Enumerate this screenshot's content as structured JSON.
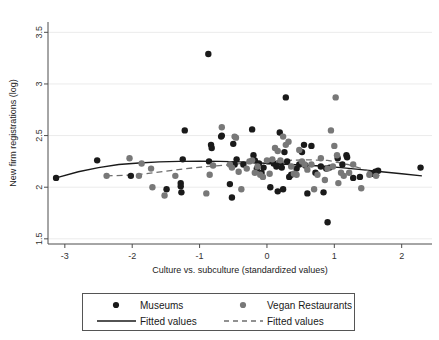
{
  "chart_data": {
    "type": "scatter",
    "title": "",
    "xlabel": "Culture vs. subculture (standardized values)",
    "ylabel": "New firm registrations (log)",
    "xlim": [
      -3.25,
      2.45
    ],
    "ylim": [
      1.45,
      3.6
    ],
    "xticks": [
      -3,
      -2,
      -1,
      0,
      1,
      2
    ],
    "xticklabels": [
      "-3",
      "-2",
      "-1",
      "0",
      "1",
      "2"
    ],
    "yticks": [
      1.5,
      2,
      2.5,
      3,
      3.5
    ],
    "yticklabels": [
      "1.5",
      "2",
      "2.5",
      "3",
      "3.5"
    ],
    "grid": "horizontal",
    "legend_position": "below",
    "colors": {
      "museums": "#1a1a1a",
      "vegan": "#787878",
      "fit_museums": "#1a1a1a",
      "fit_vegan": "#6e6e6e",
      "grid": "#ebebeb",
      "axis": "#4d4d4d",
      "background": "#ffffff"
    },
    "legend": [
      {
        "label": "Museums",
        "marker": "dot",
        "color": "#1a1a1a"
      },
      {
        "label": "Vegan Restaurants",
        "marker": "dot",
        "color": "#787878"
      },
      {
        "label": "Fitted values",
        "marker": "solid-line",
        "color": "#1a1a1a"
      },
      {
        "label": "Fitted values",
        "marker": "dashed-line",
        "color": "#6e6e6e"
      }
    ],
    "series": [
      {
        "name": "Museums",
        "marker": "dot",
        "color": "#1a1a1a",
        "points": [
          [
            -3.13,
            2.09
          ],
          [
            -2.52,
            2.26
          ],
          [
            -2.02,
            2.11
          ],
          [
            -1.49,
            1.98
          ],
          [
            -1.28,
            2.04
          ],
          [
            -1.28,
            2.01
          ],
          [
            -1.27,
            1.95
          ],
          [
            -1.25,
            2.27
          ],
          [
            -1.22,
            2.55
          ],
          [
            -0.87,
            3.29
          ],
          [
            -0.86,
            2.25
          ],
          [
            -0.83,
            2.41
          ],
          [
            -0.82,
            2.38
          ],
          [
            -0.68,
            2.49
          ],
          [
            -0.67,
            2.5
          ],
          [
            -0.55,
            2.03
          ],
          [
            -0.52,
            1.9
          ],
          [
            -0.5,
            2.42
          ],
          [
            -0.48,
            2.22
          ],
          [
            -0.45,
            2.27
          ],
          [
            -0.35,
            2.22
          ],
          [
            -0.22,
            2.56
          ],
          [
            -0.2,
            2.31
          ],
          [
            -0.18,
            2.26
          ],
          [
            -0.15,
            2.18
          ],
          [
            -0.12,
            2.23
          ],
          [
            -0.08,
            2.14
          ],
          [
            -0.05,
            2.19
          ],
          [
            0.02,
            2.25
          ],
          [
            0.05,
            2.0
          ],
          [
            0.1,
            2.23
          ],
          [
            0.14,
            2.2
          ],
          [
            0.16,
            1.96
          ],
          [
            0.19,
            2.53
          ],
          [
            0.2,
            2.24
          ],
          [
            0.22,
            2.19
          ],
          [
            0.24,
            1.98
          ],
          [
            0.26,
            2.34
          ],
          [
            0.28,
            2.87
          ],
          [
            0.3,
            2.25
          ],
          [
            0.33,
            2.1
          ],
          [
            0.36,
            2.12
          ],
          [
            0.44,
            2.18
          ],
          [
            0.48,
            2.22
          ],
          [
            0.52,
            2.34
          ],
          [
            0.55,
            2.41
          ],
          [
            0.57,
            2.21
          ],
          [
            0.6,
            1.94
          ],
          [
            0.66,
            2.4
          ],
          [
            0.72,
            2.14
          ],
          [
            0.8,
            2.2
          ],
          [
            0.84,
            1.95
          ],
          [
            0.88,
            2.18
          ],
          [
            0.9,
            1.66
          ],
          [
            0.93,
            2.19
          ],
          [
            1.05,
            2.28
          ],
          [
            1.12,
            2.22
          ],
          [
            1.18,
            2.31
          ],
          [
            1.19,
            2.29
          ],
          [
            1.28,
            2.09
          ],
          [
            1.38,
            2.1
          ],
          [
            1.57,
            2.13
          ],
          [
            1.61,
            2.15
          ],
          [
            1.65,
            2.16
          ],
          [
            2.28,
            2.19
          ]
        ]
      },
      {
        "name": "Vegan Restaurants",
        "marker": "dot",
        "color": "#787878",
        "points": [
          [
            -2.38,
            2.11
          ],
          [
            -2.04,
            2.28
          ],
          [
            -1.9,
            2.11
          ],
          [
            -1.86,
            2.23
          ],
          [
            -1.72,
            2.18
          ],
          [
            -1.7,
            2.0
          ],
          [
            -1.52,
            1.92
          ],
          [
            -1.36,
            2.11
          ],
          [
            -0.9,
            1.94
          ],
          [
            -0.85,
            2.12
          ],
          [
            -0.8,
            2.21
          ],
          [
            -0.67,
            2.58
          ],
          [
            -0.55,
            2.22
          ],
          [
            -0.52,
            2.19
          ],
          [
            -0.48,
            2.49
          ],
          [
            -0.46,
            2.48
          ],
          [
            -0.42,
            2.15
          ],
          [
            -0.38,
            1.98
          ],
          [
            -0.3,
            2.18
          ],
          [
            -0.26,
            2.25
          ],
          [
            -0.22,
            2.26
          ],
          [
            -0.18,
            2.14
          ],
          [
            -0.14,
            2.2
          ],
          [
            -0.1,
            2.12
          ],
          [
            -0.06,
            2.1
          ],
          [
            0.0,
            2.26
          ],
          [
            0.04,
            2.13
          ],
          [
            0.08,
            2.27
          ],
          [
            0.12,
            2.38
          ],
          [
            0.16,
            2.35
          ],
          [
            0.2,
            2.26
          ],
          [
            0.24,
            2.49
          ],
          [
            0.28,
            2.41
          ],
          [
            0.32,
            2.44
          ],
          [
            0.36,
            2.2
          ],
          [
            0.4,
            2.13
          ],
          [
            0.44,
            2.12
          ],
          [
            0.48,
            2.36
          ],
          [
            0.52,
            2.25
          ],
          [
            0.56,
            2.22
          ],
          [
            0.6,
            2.17
          ],
          [
            0.66,
            2.22
          ],
          [
            0.7,
            1.98
          ],
          [
            0.75,
            2.12
          ],
          [
            0.8,
            2.28
          ],
          [
            0.86,
            2.07
          ],
          [
            0.9,
            2.18
          ],
          [
            0.95,
            2.55
          ],
          [
            0.98,
            2.2
          ],
          [
            1.0,
            2.4
          ],
          [
            1.02,
            2.87
          ],
          [
            1.04,
            2.31
          ],
          [
            1.06,
            2.04
          ],
          [
            1.1,
            2.14
          ],
          [
            1.14,
            2.11
          ],
          [
            1.22,
            2.14
          ],
          [
            1.28,
            2.22
          ],
          [
            1.4,
            1.99
          ],
          [
            1.52,
            2.12
          ],
          [
            1.62,
            2.11
          ]
        ]
      }
    ],
    "fits": [
      {
        "name": "Fitted values (Museums)",
        "style": "solid",
        "color": "#1a1a1a",
        "points": [
          [
            -3.13,
            2.09
          ],
          [
            -2.8,
            2.15
          ],
          [
            -2.5,
            2.19
          ],
          [
            -2.2,
            2.22
          ],
          [
            -1.9,
            2.235
          ],
          [
            -1.6,
            2.245
          ],
          [
            -1.3,
            2.25
          ],
          [
            -1.0,
            2.252
          ],
          [
            -0.7,
            2.25
          ],
          [
            -0.4,
            2.245
          ],
          [
            -0.1,
            2.235
          ],
          [
            0.2,
            2.225
          ],
          [
            0.5,
            2.215
          ],
          [
            0.8,
            2.205
          ],
          [
            1.1,
            2.19
          ],
          [
            1.4,
            2.17
          ],
          [
            1.7,
            2.15
          ],
          [
            2.0,
            2.13
          ],
          [
            2.3,
            2.11
          ]
        ]
      },
      {
        "name": "Fitted values (Vegan Restaurants)",
        "style": "dashed",
        "color": "#6e6e6e",
        "points": [
          [
            -2.38,
            2.11
          ],
          [
            -2.1,
            2.115
          ],
          [
            -1.8,
            2.13
          ],
          [
            -1.5,
            2.155
          ],
          [
            -1.2,
            2.18
          ],
          [
            -0.9,
            2.2
          ],
          [
            -0.6,
            2.215
          ],
          [
            -0.3,
            2.235
          ],
          [
            0.0,
            2.25
          ],
          [
            0.3,
            2.26
          ],
          [
            0.6,
            2.265
          ],
          [
            0.9,
            2.26
          ],
          [
            1.2,
            2.22
          ],
          [
            1.45,
            2.17
          ],
          [
            1.7,
            2.105
          ]
        ]
      }
    ]
  }
}
